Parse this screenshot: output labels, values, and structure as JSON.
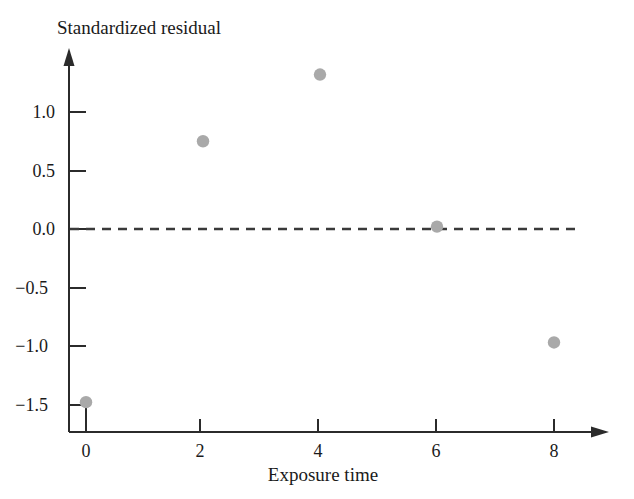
{
  "figure": {
    "background_color": "#ffffff",
    "axis_color": "#2b2b2b",
    "marker_color": "#a9a9a9",
    "reference_line_color": "#3a3a3a"
  },
  "chart_data": {
    "type": "scatter",
    "title": "",
    "subtitle": "",
    "xlabel": "Exposure time",
    "ylabel": "Standardized residual",
    "x": [
      0,
      2,
      4,
      6,
      8
    ],
    "values": [
      -1.48,
      0.75,
      1.32,
      0.02,
      -0.97
    ],
    "series": [
      {
        "name": "Standardized residuals",
        "x": [
          0,
          2,
          4,
          6,
          8
        ],
        "values": [
          -1.48,
          0.75,
          1.32,
          0.02,
          -0.97
        ]
      }
    ],
    "points": [
      {
        "x": 0,
        "y": -1.48
      },
      {
        "x": 2,
        "y": 0.75
      },
      {
        "x": 4,
        "y": 1.32
      },
      {
        "x": 6,
        "y": 0.02
      },
      {
        "x": 8,
        "y": -0.97
      }
    ],
    "xlim": [
      -0.15,
      9.0
    ],
    "ylim": [
      -1.72,
      1.6
    ],
    "xticks": [
      0,
      2,
      4,
      6,
      8
    ],
    "xtick_labels": [
      "0",
      "2",
      "4",
      "6",
      "8"
    ],
    "yticks": [
      1.0,
      0.5,
      0.0,
      -0.5,
      -1.0,
      -1.5
    ],
    "ytick_labels": [
      "1.0",
      "0.5",
      "0.0",
      "−0.5",
      "−1.0",
      "−1.5"
    ],
    "grid": false,
    "legend": false,
    "legend_position": "none",
    "annotations": [
      {
        "name": "zero-reference-line",
        "type": "horizontal-dashed-line",
        "y": 0.0,
        "style": "dashed"
      }
    ],
    "axis_style": {
      "x_axis_arrow": true,
      "y_axis_arrow": true,
      "spines": [
        "left",
        "bottom"
      ]
    }
  },
  "labels": {
    "y_axis_title": "Standardized residual",
    "x_axis_title": "Exposure time",
    "y_ticks": [
      "1.0",
      "0.5",
      "0.0",
      "−0.5",
      "−1.0",
      "−1.5"
    ],
    "x_ticks": [
      "0",
      "2",
      "4",
      "6",
      "8"
    ]
  }
}
